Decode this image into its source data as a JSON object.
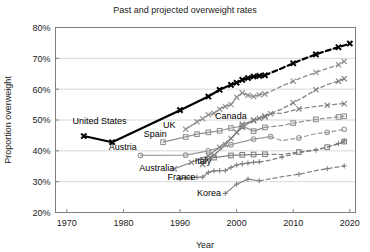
{
  "chart_data": {
    "type": "line",
    "title": "Past and projected overweight rates",
    "xlabel": "Year",
    "ylabel": "Proportion overweight",
    "xlim": [
      1968,
      2021
    ],
    "ylim": [
      20,
      80
    ],
    "xticks": [
      1970,
      1980,
      1990,
      2000,
      2010,
      2020
    ],
    "xtick_labels": [
      "1970",
      "1980",
      "1990",
      "2000",
      "2010",
      "2020"
    ],
    "yticks": [
      20,
      30,
      40,
      50,
      60,
      70,
      80
    ],
    "ytick_labels": [
      "20%",
      "30%",
      "40%",
      "50%",
      "60%",
      "70%",
      "80%"
    ],
    "grid": true,
    "legend": "inline-labels",
    "note": "Solid segments are observed data; dashed segments are projections.",
    "series": [
      {
        "name": "United States",
        "color": "#000000",
        "marker": "x",
        "width": 2.2,
        "label_x": 1971.0,
        "label_y": 48.6,
        "label_anchor": "start",
        "observed": [
          [
            1973,
            44.8
          ],
          [
            1978,
            42.8
          ],
          [
            1990,
            53.2
          ],
          [
            1995,
            57.6
          ],
          [
            1997,
            59.8
          ],
          [
            1999,
            61.4
          ],
          [
            2000,
            62.1
          ],
          [
            2001,
            63.0
          ],
          [
            2002,
            63.6
          ],
          [
            2003,
            64.1
          ],
          [
            2004,
            64.3
          ],
          [
            2005,
            64.5
          ]
        ],
        "projected": [
          [
            2005,
            64.5
          ],
          [
            2008,
            66.8
          ],
          [
            2010,
            68.4
          ],
          [
            2012,
            69.9
          ],
          [
            2014,
            71.3
          ],
          [
            2016,
            72.5
          ],
          [
            2018,
            73.6
          ],
          [
            2020,
            74.8
          ]
        ]
      },
      {
        "name": "UK",
        "color": "#909090",
        "marker": "x",
        "width": 1.3,
        "label_x": 1987.0,
        "label_y": 47.4,
        "label_anchor": "start",
        "observed": [
          [
            1991,
            47.0
          ],
          [
            1993,
            49.4
          ],
          [
            1994,
            50.4
          ],
          [
            1995,
            51.7
          ],
          [
            1996,
            52.2
          ],
          [
            1997,
            53.5
          ],
          [
            1998,
            54.4
          ],
          [
            1999,
            55.0
          ],
          [
            2000,
            57.4
          ],
          [
            2001,
            58.8
          ],
          [
            2002,
            58.0
          ],
          [
            2003,
            57.6
          ],
          [
            2004,
            58.2
          ],
          [
            2005,
            58.4
          ]
        ],
        "projected": [
          [
            2005,
            58.4
          ],
          [
            2008,
            61.0
          ],
          [
            2010,
            62.6
          ],
          [
            2012,
            64.1
          ],
          [
            2014,
            65.4
          ],
          [
            2016,
            66.7
          ],
          [
            2018,
            67.9
          ],
          [
            2019,
            69.0
          ]
        ]
      },
      {
        "name": "Canada",
        "color": "#808080",
        "marker": "x",
        "width": 1.3,
        "label_x": 1996.2,
        "label_y": 50.3,
        "label_anchor": "start",
        "observed": [
          [
            1994,
            35.6
          ],
          [
            1995,
            37.4
          ],
          [
            1996,
            38.6
          ],
          [
            1998,
            42.0
          ],
          [
            2000,
            46.0
          ],
          [
            2001,
            48.6
          ],
          [
            2003,
            49.8
          ],
          [
            2004,
            50.6
          ],
          [
            2005,
            51.3
          ]
        ],
        "projected": [
          [
            2005,
            51.3
          ],
          [
            2008,
            53.6
          ],
          [
            2010,
            55.6
          ],
          [
            2012,
            57.6
          ],
          [
            2014,
            59.8
          ],
          [
            2016,
            61.5
          ],
          [
            2018,
            62.6
          ],
          [
            2019,
            63.4
          ]
        ]
      },
      {
        "name": "Spain",
        "color": "#909090",
        "marker": "square",
        "width": 1.2,
        "label_x": 1983.6,
        "label_y": 44.4,
        "label_anchor": "start",
        "observed": [
          [
            1987,
            42.8
          ],
          [
            1991,
            44.5
          ],
          [
            1993,
            45.4
          ],
          [
            1995,
            46.0
          ],
          [
            1997,
            46.5
          ],
          [
            1999,
            47.4
          ],
          [
            2001,
            48.0
          ],
          [
            2003,
            46.4
          ],
          [
            2005,
            47.6
          ]
        ],
        "projected": [
          [
            2005,
            47.6
          ],
          [
            2008,
            48.2
          ],
          [
            2010,
            49.0
          ],
          [
            2012,
            49.6
          ],
          [
            2014,
            50.2
          ],
          [
            2016,
            50.6
          ],
          [
            2018,
            51.0
          ],
          [
            2019,
            51.2
          ]
        ]
      },
      {
        "name": "Austria",
        "color": "#9a9a9a",
        "marker": "circle",
        "width": 1.2,
        "label_x": 1977.4,
        "label_y": 40.2,
        "label_anchor": "start",
        "observed": [
          [
            1983,
            38.5
          ],
          [
            1991,
            38.6
          ],
          [
            1995,
            40.0
          ],
          [
            1999,
            42.0
          ],
          [
            2003,
            43.8
          ],
          [
            2006,
            44.6
          ]
        ],
        "projected": [
          [
            2006,
            44.6
          ],
          [
            2008,
            43.3
          ],
          [
            2011,
            44.2
          ],
          [
            2014,
            45.6
          ],
          [
            2016,
            46.0
          ],
          [
            2018,
            46.6
          ],
          [
            2019,
            47.0
          ]
        ]
      },
      {
        "name": "Australia",
        "color": "#808080",
        "marker": "x",
        "width": 1.2,
        "label_x": 1982.8,
        "label_y": 33.3,
        "label_anchor": "start",
        "observed": [
          [
            1989,
            34.2
          ],
          [
            1992,
            36.2
          ],
          [
            1995,
            38.4
          ],
          [
            1997,
            41.2
          ],
          [
            1999,
            44.0
          ],
          [
            2001,
            47.6
          ],
          [
            2003,
            50.0
          ],
          [
            2005,
            51.0
          ],
          [
            2006,
            52.0
          ]
        ],
        "projected": [
          [
            2006,
            52.0
          ],
          [
            2008,
            52.2
          ],
          [
            2011,
            53.6
          ],
          [
            2014,
            54.4
          ],
          [
            2016,
            54.8
          ],
          [
            2018,
            55.2
          ],
          [
            2019,
            55.3
          ]
        ]
      },
      {
        "name": "Italy",
        "color": "#808080",
        "marker": "square",
        "width": 1.2,
        "label_x": 1992.6,
        "label_y": 35.6,
        "label_anchor": "start",
        "observed": [
          [
            1994,
            37.1
          ],
          [
            1996,
            37.8
          ],
          [
            1999,
            38.5
          ],
          [
            2001,
            38.7
          ],
          [
            2003,
            38.8
          ],
          [
            2005,
            38.9
          ]
        ],
        "projected": [
          [
            2005,
            38.9
          ],
          [
            2008,
            38.8
          ],
          [
            2011,
            39.6
          ],
          [
            2014,
            40.4
          ],
          [
            2016,
            41.2
          ],
          [
            2018,
            42.2
          ],
          [
            2019,
            43.0
          ]
        ]
      },
      {
        "name": "France",
        "color": "#808080",
        "marker": "plus",
        "width": 1.2,
        "label_x": 1987.8,
        "label_y": 30.7,
        "label_anchor": "start",
        "observed": [
          [
            1990,
            31.0
          ],
          [
            1991,
            31.2
          ],
          [
            1992,
            31.3
          ],
          [
            1993,
            31.4
          ],
          [
            1994,
            31.5
          ],
          [
            1995,
            33.0
          ],
          [
            1996,
            33.5
          ],
          [
            1997,
            33.6
          ],
          [
            1998,
            33.6
          ],
          [
            1999,
            34.6
          ],
          [
            2000,
            35.4
          ],
          [
            2001,
            35.8
          ],
          [
            2002,
            36.0
          ],
          [
            2003,
            36.3
          ],
          [
            2004,
            36.4
          ]
        ],
        "projected": [
          [
            2004,
            36.4
          ],
          [
            2006,
            37.0
          ],
          [
            2008,
            38.0
          ],
          [
            2011,
            39.4
          ],
          [
            2014,
            40.2
          ],
          [
            2016,
            41.2
          ],
          [
            2018,
            42.4
          ],
          [
            2019,
            43.2
          ]
        ]
      },
      {
        "name": "Korea",
        "color": "#808080",
        "marker": "plus",
        "width": 1.2,
        "label_x": 1993.0,
        "label_y": 25.2,
        "label_anchor": "start",
        "observed": [
          [
            1998,
            26.2
          ],
          [
            2000,
            29.2
          ],
          [
            2002,
            30.8
          ],
          [
            2004,
            30.3
          ]
        ],
        "projected": [
          [
            2004,
            30.3
          ],
          [
            2008,
            31.6
          ],
          [
            2011,
            32.4
          ],
          [
            2014,
            33.6
          ],
          [
            2016,
            34.2
          ],
          [
            2018,
            34.8
          ],
          [
            2019,
            35.1
          ]
        ]
      }
    ]
  }
}
